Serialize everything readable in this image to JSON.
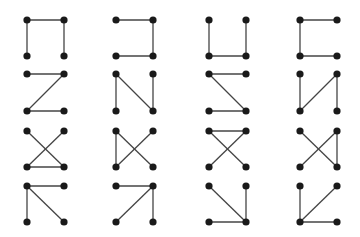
{
  "diagram": {
    "title": "",
    "colors": {
      "background": "#ffffff",
      "dot": "#1a1a1a",
      "line": "#444444"
    },
    "columns": [
      [
        27,
        64
      ],
      [
        116,
        153
      ],
      [
        209,
        246
      ],
      [
        300,
        337
      ]
    ],
    "rows": [
      [
        20,
        56
      ],
      [
        74,
        111
      ],
      [
        131,
        167
      ],
      [
        186,
        222
      ]
    ],
    "patterns": [
      {
        "id": 1,
        "row": 0,
        "col": 0,
        "edges": [
          [
            "BL",
            "TL"
          ],
          [
            "TL",
            "TR"
          ],
          [
            "TR",
            "BR"
          ]
        ]
      },
      {
        "id": 2,
        "row": 0,
        "col": 1,
        "edges": [
          [
            "TL",
            "TR"
          ],
          [
            "TR",
            "BR"
          ],
          [
            "BR",
            "BL"
          ]
        ]
      },
      {
        "id": 3,
        "row": 0,
        "col": 2,
        "edges": [
          [
            "TL",
            "BL"
          ],
          [
            "BL",
            "BR"
          ],
          [
            "BR",
            "TR"
          ]
        ]
      },
      {
        "id": 4,
        "row": 0,
        "col": 3,
        "edges": [
          [
            "TR",
            "TL"
          ],
          [
            "TL",
            "BL"
          ],
          [
            "BL",
            "BR"
          ]
        ]
      },
      {
        "id": 5,
        "row": 1,
        "col": 0,
        "edges": [
          [
            "TL",
            "TR"
          ],
          [
            "TR",
            "BL"
          ],
          [
            "BL",
            "BR"
          ]
        ]
      },
      {
        "id": 6,
        "row": 1,
        "col": 1,
        "edges": [
          [
            "BL",
            "TL"
          ],
          [
            "TL",
            "BR"
          ],
          [
            "BR",
            "TR"
          ]
        ]
      },
      {
        "id": 7,
        "row": 1,
        "col": 2,
        "edges": [
          [
            "TR",
            "TL"
          ],
          [
            "TL",
            "BR"
          ],
          [
            "BR",
            "BL"
          ]
        ]
      },
      {
        "id": 8,
        "row": 1,
        "col": 3,
        "edges": [
          [
            "TL",
            "BL"
          ],
          [
            "BL",
            "TR"
          ],
          [
            "TR",
            "BR"
          ]
        ]
      },
      {
        "id": 9,
        "row": 2,
        "col": 0,
        "edges": [
          [
            "TL",
            "BR"
          ],
          [
            "BR",
            "BL"
          ],
          [
            "BL",
            "TR"
          ]
        ]
      },
      {
        "id": 10,
        "row": 2,
        "col": 1,
        "edges": [
          [
            "BL",
            "TL"
          ],
          [
            "TL",
            "BR"
          ],
          [
            "BL",
            "TR"
          ]
        ]
      },
      {
        "id": 11,
        "row": 2,
        "col": 2,
        "edges": [
          [
            "BL",
            "TR"
          ],
          [
            "TR",
            "TL"
          ],
          [
            "TL",
            "BR"
          ]
        ]
      },
      {
        "id": 12,
        "row": 2,
        "col": 3,
        "edges": [
          [
            "TL",
            "BR"
          ],
          [
            "BR",
            "TR"
          ],
          [
            "TR",
            "BL"
          ]
        ]
      },
      {
        "id": 13,
        "row": 3,
        "col": 0,
        "edges": [
          [
            "TL",
            "TR"
          ],
          [
            "TL",
            "BL"
          ],
          [
            "TL",
            "BR"
          ]
        ]
      },
      {
        "id": 14,
        "row": 3,
        "col": 1,
        "edges": [
          [
            "TR",
            "TL"
          ],
          [
            "TR",
            "BL"
          ],
          [
            "TR",
            "BR"
          ]
        ]
      },
      {
        "id": 15,
        "row": 3,
        "col": 2,
        "edges": [
          [
            "BR",
            "TL"
          ],
          [
            "BR",
            "TR"
          ],
          [
            "BR",
            "BL"
          ]
        ]
      },
      {
        "id": 16,
        "row": 3,
        "col": 3,
        "edges": [
          [
            "BL",
            "TL"
          ],
          [
            "BL",
            "TR"
          ],
          [
            "BL",
            "BR"
          ]
        ]
      }
    ]
  }
}
